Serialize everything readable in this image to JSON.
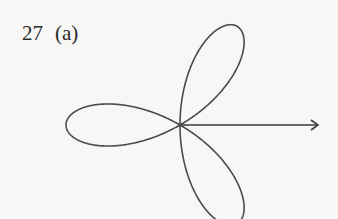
{
  "problem": {
    "number": "27",
    "part": "(a)"
  },
  "diagram": {
    "type": "polar rose curve",
    "petals": 3,
    "petal_directions_deg": [
      60,
      180,
      -60
    ],
    "polar_axis_arrow": true,
    "stroke_color": "#4a4a4a",
    "background_color": "#f7f7f5"
  }
}
